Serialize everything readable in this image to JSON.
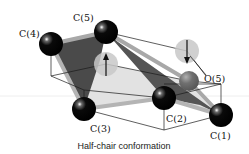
{
  "diagram": {
    "title": "Half-chair conformation",
    "caption": "Half-chair conformation",
    "atoms": [
      {
        "id": "C1",
        "label": "C(1)",
        "element": "carbon",
        "x": 221,
        "y": 115,
        "r": 12,
        "color": "#000000"
      },
      {
        "id": "C2",
        "label": "C(2)",
        "element": "carbon",
        "x": 164,
        "y": 98,
        "r": 12,
        "color": "#000000"
      },
      {
        "id": "C3",
        "label": "C(3)",
        "element": "carbon",
        "x": 84,
        "y": 109,
        "r": 12,
        "color": "#000000"
      },
      {
        "id": "C4",
        "label": "C(4)",
        "element": "carbon",
        "x": 51,
        "y": 44,
        "r": 12,
        "color": "#000000"
      },
      {
        "id": "C5",
        "label": "C(5)",
        "element": "carbon",
        "x": 106,
        "y": 32,
        "r": 12,
        "color": "#000000"
      },
      {
        "id": "O5",
        "label": "O(5)",
        "element": "oxygen",
        "x": 189,
        "y": 81,
        "r": 10,
        "color": "#6e6e6e"
      }
    ],
    "labels": {
      "c1": "C(1)",
      "c2": "C(2)",
      "c3": "C(3)",
      "c4": "C(4)",
      "c5": "C(5)",
      "o5": "O(5)"
    },
    "displacement_markers": [
      {
        "id": "up-marker",
        "direction": "up",
        "x": 106,
        "y": 64,
        "r": 12,
        "color": "#c8c8c8"
      },
      {
        "id": "down-marker",
        "direction": "down",
        "x": 187,
        "y": 51,
        "r": 12,
        "color": "#c8c8c8"
      }
    ],
    "colors": {
      "carbon": "#000000",
      "oxygen": "#6e6e6e",
      "bond_plane_dark": "#4a4a4a",
      "bond_plane_light": "#d9d9d9",
      "bond_rim": "#a8a8a8",
      "halo": "#c8c8c8",
      "reference_line": "#1a1a1a",
      "background": "#ffffff"
    }
  }
}
